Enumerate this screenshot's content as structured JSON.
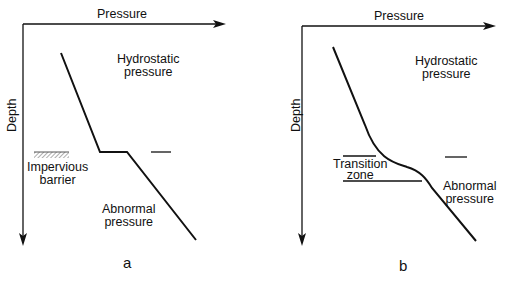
{
  "panels": [
    {
      "id": "a",
      "caption": "a",
      "x_axis_label": "Pressure",
      "y_axis_label": "Depth",
      "labels": {
        "hydrostatic": [
          "Hydrostatic",
          "pressure"
        ],
        "barrier": [
          "Impervious",
          "barrier"
        ],
        "abnormal": [
          "Abnormal",
          "pressure"
        ]
      }
    },
    {
      "id": "b",
      "caption": "b",
      "x_axis_label": "Pressure",
      "y_axis_label": "Depth",
      "labels": {
        "hydrostatic": [
          "Hydrostatic",
          "pressure"
        ],
        "transition": [
          "Transition",
          "zone"
        ],
        "abnormal": [
          "Abnormal",
          "pressure"
        ]
      }
    }
  ],
  "colors": {
    "line": "#111111",
    "background": "#ffffff",
    "hatch": "#777777"
  }
}
